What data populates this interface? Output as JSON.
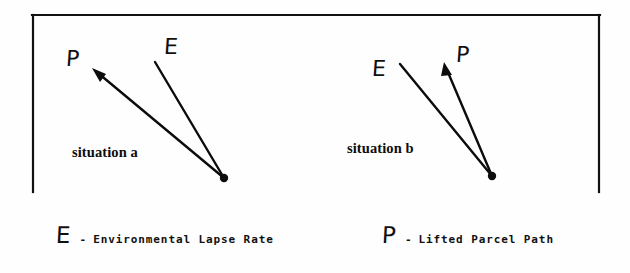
{
  "figure": {
    "background_color": "#fefefe",
    "ink_color": "#0c0c0c"
  },
  "frame": {
    "name": "open-rectangle-border",
    "left": 32,
    "right": 600,
    "top": 15,
    "bottom": 192,
    "sides_drawn": "top, left, right"
  },
  "panels": [
    {
      "id": "a",
      "caption": "situation a",
      "caption_x": 72,
      "caption_y": 145,
      "origin": {
        "x": 224,
        "y": 178
      },
      "rays": [
        {
          "symbol": "P",
          "meaning": "Lifted Parcel Path",
          "tip": {
            "x": 92,
            "y": 68
          },
          "arrowhead": true,
          "label_x": 66,
          "label_y": 48
        },
        {
          "symbol": "E",
          "meaning": "Environmental Lapse Rate",
          "tip": {
            "x": 155,
            "y": 62
          },
          "arrowhead": false,
          "label_x": 164,
          "label_y": 36
        }
      ]
    },
    {
      "id": "b",
      "caption": "situation b",
      "caption_x": 347,
      "caption_y": 141,
      "origin": {
        "x": 492,
        "y": 176
      },
      "rays": [
        {
          "symbol": "E",
          "meaning": "Environmental Lapse Rate",
          "tip": {
            "x": 400,
            "y": 64
          },
          "arrowhead": false,
          "label_x": 372,
          "label_y": 58
        },
        {
          "symbol": "P",
          "meaning": "Lifted Parcel Path",
          "tip": {
            "x": 444,
            "y": 62
          },
          "arrowhead": true,
          "label_x": 456,
          "label_y": 44
        }
      ]
    }
  ],
  "legend": {
    "entries": [
      {
        "symbol": "E",
        "dash": "-",
        "description": "Environmental Lapse Rate",
        "x": 56,
        "y": 224
      },
      {
        "symbol": "P",
        "dash": "-",
        "description": "Lifted Parcel Path",
        "x": 382,
        "y": 224
      }
    ]
  }
}
